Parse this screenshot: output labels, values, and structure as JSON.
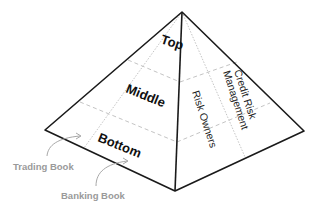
{
  "diagram": {
    "type": "pyramid",
    "left_face_levels": [
      {
        "label": "Top"
      },
      {
        "label": "Middle"
      },
      {
        "label": "Bottom"
      }
    ],
    "right_face_labels": [
      {
        "label": "Risk Owners"
      },
      {
        "label": "Credit Risk"
      },
      {
        "label": "Management"
      }
    ],
    "annotations": [
      {
        "label": "Trading Book"
      },
      {
        "label": "Banking Book"
      }
    ],
    "colors": {
      "outline": "#1a1a1a",
      "dashed": "#bdbdbd",
      "dotted": "#b0b0b0",
      "annotation": "#9a9a9a"
    }
  }
}
